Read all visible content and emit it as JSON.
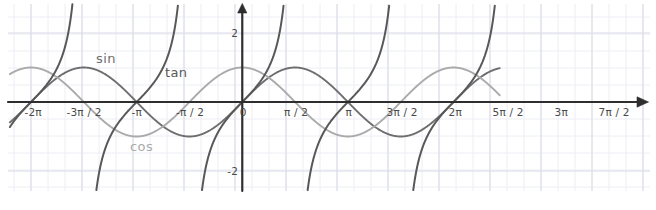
{
  "chart_data": {
    "type": "line",
    "title": "",
    "xlabel": "",
    "ylabel": "",
    "grid": true,
    "grid_style": "graph-paper",
    "legend": "inline-curve-labels",
    "xlim": [
      -6.9115,
      7.6576
    ],
    "ylim": [
      -2.8116,
      2.9275
    ],
    "x_unit": "radians (multiples of pi)",
    "x_ticks": [
      {
        "label": "-2π",
        "value": -6.2832,
        "px": 31
      },
      {
        "label": "-3π / 2",
        "value": -4.7124,
        "px": 82
      },
      {
        "label": "-π",
        "value": -3.1416,
        "px": 135
      },
      {
        "label": "-π / 2",
        "value": -1.5708,
        "px": 188
      },
      {
        "label": "0",
        "value": 0.0,
        "px": 241
      },
      {
        "label": "π / 2",
        "value": 1.5708,
        "px": 294
      },
      {
        "label": "π",
        "value": 3.1416,
        "px": 347
      },
      {
        "label": "3π / 2",
        "value": 4.7124,
        "px": 400
      },
      {
        "label": "2π",
        "value": 6.2832,
        "px": 453
      },
      {
        "label": "5π / 2",
        "value": 7.854,
        "px": 506
      },
      {
        "label": "3π",
        "value": 9.4248,
        "px": 559
      },
      {
        "label": "7π / 2",
        "value": 10.9956,
        "px": 612
      }
    ],
    "y_ticks": [
      {
        "label": "2",
        "value": 2.0,
        "px": 33
      },
      {
        "label": "-2",
        "value": -2.0,
        "px": 171
      }
    ],
    "series": [
      {
        "name": "sin",
        "label": "sin",
        "formula": "y = sin(x)",
        "color": "#6e6e6e",
        "width": 1.9,
        "label_px": {
          "x": 96,
          "y": 52
        },
        "amplitude": 1,
        "period": 6.2832,
        "phase": 0,
        "key_points": [
          {
            "x": -6.2832,
            "y": 0
          },
          {
            "x": -4.7124,
            "y": -1
          },
          {
            "x": -3.1416,
            "y": 0
          },
          {
            "x": -1.5708,
            "y": 1
          },
          {
            "x": 0,
            "y": 0
          },
          {
            "x": 1.5708,
            "y": 1
          },
          {
            "x": 3.1416,
            "y": 0
          },
          {
            "x": 4.7124,
            "y": -1
          },
          {
            "x": 6.2832,
            "y": 0
          },
          {
            "x": 7.854,
            "y": 1
          },
          {
            "x": 9.4248,
            "y": 0
          },
          {
            "x": 10.9956,
            "y": -1
          }
        ]
      },
      {
        "name": "cos",
        "label": "cos",
        "formula": "y = cos(x)",
        "color": "#aaaaaa",
        "width": 1.9,
        "label_px": {
          "x": 130,
          "y": 140
        },
        "amplitude": 1,
        "period": 6.2832,
        "phase": 1.5708,
        "key_points": [
          {
            "x": -6.2832,
            "y": 1
          },
          {
            "x": -4.7124,
            "y": 0
          },
          {
            "x": -3.1416,
            "y": -1
          },
          {
            "x": -1.5708,
            "y": 0
          },
          {
            "x": 0,
            "y": 1
          },
          {
            "x": 1.5708,
            "y": 0
          },
          {
            "x": 3.1416,
            "y": -1
          },
          {
            "x": 4.7124,
            "y": 0
          },
          {
            "x": 6.2832,
            "y": 1
          },
          {
            "x": 7.854,
            "y": 0
          },
          {
            "x": 9.4248,
            "y": -1
          },
          {
            "x": 10.9956,
            "y": 0
          }
        ]
      },
      {
        "name": "tan",
        "label": "tan",
        "formula": "y = tan(x)",
        "color": "#585858",
        "width": 2.0,
        "label_px": {
          "x": 165,
          "y": 66
        },
        "period": 3.1416,
        "asymptotes": [
          -4.7124,
          -1.5708,
          1.5708,
          4.7124,
          7.854,
          10.9956
        ],
        "zeros": [
          -6.2832,
          -3.1416,
          0,
          3.1416,
          6.2832,
          9.4248
        ]
      }
    ],
    "axes": {
      "x_axis_color": "#2e2e2e",
      "y_axis_color": "#2e2e2e",
      "arrow_x": true,
      "arrow_y": true
    },
    "colors": {
      "background": "#ffffff",
      "grid_minor": "#edeef4",
      "grid_major": "#d8dae6",
      "tick_text": "#4a4a4a"
    }
  }
}
